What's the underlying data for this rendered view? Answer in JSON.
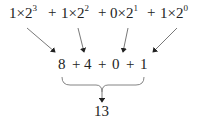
{
  "diagram": {
    "top_row": {
      "terms": [
        {
          "coef": "1",
          "times": "×",
          "base": "2",
          "exp": "3"
        },
        {
          "coef": "1",
          "times": "×",
          "base": "2",
          "exp": "2"
        },
        {
          "coef": "0",
          "times": "×",
          "base": "2",
          "exp": "1"
        },
        {
          "coef": "1",
          "times": "×",
          "base": "2",
          "exp": "0"
        }
      ],
      "operator": "+"
    },
    "middle_row": {
      "values": [
        "8",
        "4",
        "0",
        "1"
      ],
      "operator": "+"
    },
    "result": "13",
    "colors": {
      "ink": "#222222",
      "background": "#ffffff"
    }
  }
}
